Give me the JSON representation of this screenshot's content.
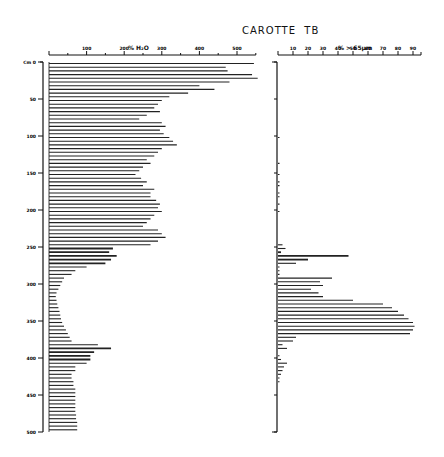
{
  "chart_data": [
    {
      "type": "bar",
      "orientation": "horizontal",
      "title": "CAROTTE TB",
      "xlabel": "% H2O",
      "ylabel": "Cm",
      "xlim": [
        0,
        550
      ],
      "ylim": [
        0,
        500
      ],
      "x_ticks": [
        0,
        100,
        200,
        300,
        400,
        500
      ],
      "y_ticks": [
        0,
        50,
        100,
        150,
        200,
        250,
        300,
        350,
        400,
        450,
        500
      ],
      "depth_step_cm": 5,
      "depth": [
        0,
        5,
        10,
        15,
        20,
        25,
        30,
        35,
        40,
        45,
        50,
        55,
        60,
        65,
        70,
        75,
        80,
        85,
        90,
        95,
        100,
        105,
        110,
        115,
        120,
        125,
        130,
        135,
        140,
        145,
        150,
        155,
        160,
        165,
        170,
        175,
        180,
        185,
        190,
        195,
        200,
        205,
        210,
        215,
        220,
        225,
        230,
        235,
        240,
        245,
        250,
        255,
        260,
        265,
        270,
        275,
        280,
        285,
        290,
        295,
        300,
        305,
        310,
        315,
        320,
        325,
        330,
        335,
        340,
        345,
        350,
        355,
        360,
        365,
        370,
        375,
        380,
        385,
        390,
        395,
        400,
        405,
        410,
        415,
        420,
        425,
        430,
        435,
        440,
        445,
        450,
        455,
        460,
        465,
        470,
        475,
        480,
        485,
        490,
        495
      ],
      "values": [
        545,
        470,
        475,
        540,
        555,
        480,
        400,
        440,
        370,
        320,
        300,
        290,
        280,
        295,
        260,
        240,
        300,
        310,
        295,
        305,
        320,
        330,
        340,
        300,
        290,
        280,
        260,
        270,
        250,
        240,
        230,
        245,
        260,
        250,
        280,
        270,
        270,
        285,
        295,
        290,
        300,
        280,
        270,
        260,
        250,
        290,
        300,
        310,
        290,
        270,
        170,
        160,
        180,
        165,
        150,
        100,
        70,
        60,
        40,
        35,
        30,
        25,
        20,
        18,
        20,
        22,
        25,
        28,
        30,
        32,
        35,
        40,
        45,
        50,
        55,
        60,
        130,
        165,
        120,
        110,
        110,
        100,
        70,
        70,
        60,
        60,
        65,
        65,
        70,
        70,
        70,
        70,
        70,
        70,
        70,
        72,
        72,
        75,
        75,
        75
      ]
    },
    {
      "type": "bar",
      "orientation": "horizontal",
      "xlabel": "% > 65µm",
      "ylabel": "Cm",
      "xlim": [
        0,
        95
      ],
      "ylim": [
        0,
        500
      ],
      "x_ticks": [
        0,
        10,
        20,
        30,
        40,
        50,
        60,
        70,
        80,
        90
      ],
      "depth_step_cm": 5,
      "values": [
        0,
        0,
        0,
        0,
        0,
        0,
        0,
        0,
        0,
        0,
        0,
        0,
        0,
        0,
        0,
        0,
        0,
        0,
        0,
        0,
        1,
        0,
        0,
        0,
        0,
        0,
        0,
        1,
        0,
        0,
        1,
        0,
        1,
        1,
        0,
        1,
        1,
        0,
        1,
        0,
        1,
        0,
        0,
        0,
        0,
        0,
        0,
        0,
        0,
        3,
        5,
        2,
        47,
        20,
        12,
        1,
        1,
        1,
        36,
        28,
        30,
        22,
        27,
        30,
        50,
        70,
        76,
        80,
        84,
        87,
        90,
        91,
        90,
        88,
        12,
        10,
        3,
        6,
        0,
        1,
        2,
        6,
        4,
        3,
        2,
        1,
        1,
        0,
        0,
        0,
        0,
        0,
        0,
        0,
        0,
        0,
        0,
        0,
        0,
        0
      ]
    }
  ],
  "labels": {
    "title": "CAROTTE  TB",
    "left_xlabel": "% H₂O",
    "right_xlabel": "% > 65µm",
    "depth_unit": "Cm 0"
  }
}
